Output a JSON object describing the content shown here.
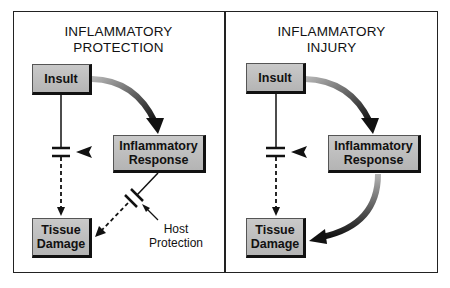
{
  "panels": [
    {
      "title_line1": "INFLAMMATORY",
      "title_line2": "PROTECTION",
      "nodes": {
        "insult": "Insult",
        "response_line1": "Inflammatory",
        "response_line2": "Response",
        "damage_line1": "Tissue",
        "damage_line2": "Damage"
      },
      "annotation_line1": "Host",
      "annotation_line2": "Protection"
    },
    {
      "title_line1": "INFLAMMATORY",
      "title_line2": "INJURY",
      "nodes": {
        "insult": "Insult",
        "response_line1": "Inflammatory",
        "response_line2": "Response",
        "damage_line1": "Tissue",
        "damage_line2": "Damage"
      }
    }
  ],
  "colors": {
    "box_fill": "#bdbdbd",
    "line": "#111111",
    "arrow_gradient_start": "#b0b0b0",
    "arrow_gradient_end": "#111111"
  }
}
